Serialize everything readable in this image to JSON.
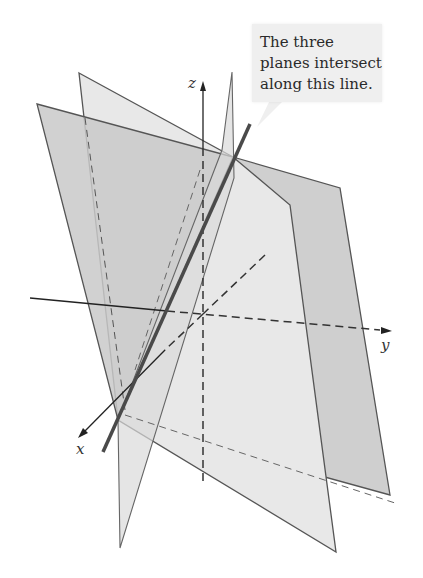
{
  "callout": {
    "text": "The three\nplanes intersect\nalong this line."
  },
  "axes": {
    "x_label": "x",
    "y_label": "y",
    "z_label": "z"
  },
  "colors": {
    "plane_light": "#e6e6e6",
    "plane_mid": "#d6d6d6",
    "plane_dark": "#c4c4c4",
    "edge": "#555555",
    "intersection_line": "#4a4a4a",
    "axis": "#222222",
    "callout_bg": "#efefef"
  }
}
